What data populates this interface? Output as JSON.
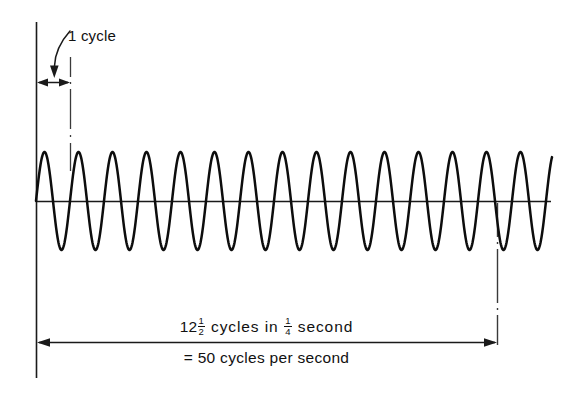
{
  "figure": {
    "background_color": "#ffffff",
    "ink_color": "#111111",
    "annotations": {
      "cycle_label": "1 cycle",
      "caption_line1_pre": "12",
      "caption_line1_frac1_num": "1",
      "caption_line1_frac1_den": "2",
      "caption_line1_mid": " cycles in ",
      "caption_line1_frac2_num": "1",
      "caption_line1_frac2_den": "4",
      "caption_line1_post": " second",
      "caption_line2": "= 50 cycles per second"
    }
  },
  "chart_data": {
    "type": "line",
    "xlabel": "",
    "ylabel": "",
    "series": [
      {
        "name": "sine wave",
        "description": "continuous sinusoid drawn left to right along a horizontal zero axis",
        "amplitude": 1.0,
        "cycles_drawn": 14.2,
        "cycles_measured": 12.5,
        "period_px": 34,
        "start_phase": "rising from zero"
      }
    ],
    "measurements": {
      "cycles": 12.5,
      "duration_seconds": 0.25,
      "frequency_cycles_per_second": 50,
      "one_cycle_span_px": 34
    },
    "axis_lines": {
      "vertical_axis_x_px": 36,
      "vertical_axis_y_top_px": 22,
      "vertical_axis_y_bottom_px": 378,
      "horizontal_baseline_y_px": 201,
      "horizontal_baseline_x_start_px": 36,
      "horizontal_baseline_x_end_px": 551
    },
    "markers": [
      {
        "name": "one-cycle-start-line",
        "type": "solid-vertical",
        "x_px": 36
      },
      {
        "name": "one-cycle-end-line",
        "type": "dashed-vertical",
        "x_px": 70,
        "y_from_px": 57,
        "y_to_px": 172
      },
      {
        "name": "quarter-second-end-line",
        "type": "dashed-vertical",
        "x_px": 497,
        "y_from_px": 205,
        "y_to_px": 345
      }
    ],
    "dimension_arrows": [
      {
        "name": "one-cycle-arrow",
        "y_px": 82,
        "x_from_px": 37,
        "x_to_px": 70,
        "heads": "both"
      },
      {
        "name": "quarter-second-arrow",
        "y_px": 342,
        "x_from_px": 37,
        "x_to_px": 497,
        "heads": "both"
      }
    ],
    "grid": false,
    "legend": false
  }
}
